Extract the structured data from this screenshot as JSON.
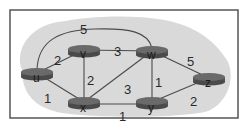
{
  "diagram": {
    "type": "network-graph",
    "nodes": [
      {
        "id": "u",
        "label": "u",
        "cx": 37,
        "cy": 73
      },
      {
        "id": "v",
        "label": "v",
        "cx": 84,
        "cy": 50
      },
      {
        "id": "w",
        "label": "w",
        "cx": 152,
        "cy": 51
      },
      {
        "id": "x",
        "label": "x",
        "cx": 84,
        "cy": 102
      },
      {
        "id": "y",
        "label": "y",
        "cx": 152,
        "cy": 102
      },
      {
        "id": "z",
        "label": "z",
        "cx": 209,
        "cy": 78
      }
    ],
    "edges": [
      {
        "from": "u",
        "to": "v",
        "cost": "2"
      },
      {
        "from": "u",
        "to": "w",
        "cost": "5"
      },
      {
        "from": "u",
        "to": "x",
        "cost": "1"
      },
      {
        "from": "v",
        "to": "w",
        "cost": "3"
      },
      {
        "from": "v",
        "to": "x",
        "cost": "2"
      },
      {
        "from": "x",
        "to": "w",
        "cost": "3"
      },
      {
        "from": "w",
        "to": "y",
        "cost": "1"
      },
      {
        "from": "x",
        "to": "y",
        "cost": "1"
      },
      {
        "from": "w",
        "to": "z",
        "cost": "5"
      },
      {
        "from": "y",
        "to": "z",
        "cost": "2"
      }
    ]
  },
  "colors": {
    "frame": "#555555",
    "cloud": "#d9d9d9",
    "edge": "#4a4a4a",
    "node_fill": "#5f5f5f",
    "node_top": "#6e6e6e"
  }
}
